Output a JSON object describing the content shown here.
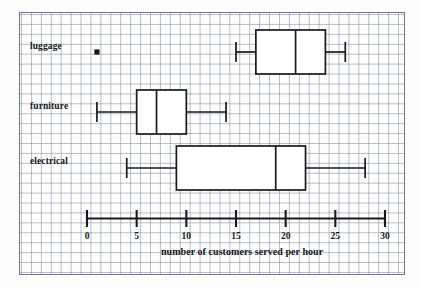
{
  "chart_data": {
    "type": "box",
    "title": "",
    "xlabel": "number of customers served per hour",
    "ylabel": "",
    "xlim": [
      0,
      30
    ],
    "xticks": [
      0,
      5,
      10,
      15,
      20,
      25,
      30
    ],
    "xtick_labels": [
      "0",
      "5",
      "10",
      "15",
      "20",
      "25",
      "30"
    ],
    "grid": true,
    "legend": "none",
    "orientation": "horizontal",
    "categories": [
      "luggage",
      "furniture",
      "electrical"
    ],
    "boxes": [
      {
        "category": "luggage",
        "whisker_low": 15,
        "q1": 17,
        "median": 21,
        "q3": 24,
        "whisker_high": 26,
        "outliers": [
          1
        ]
      },
      {
        "category": "furniture",
        "whisker_low": 1,
        "q1": 5,
        "median": 7,
        "q3": 10,
        "whisker_high": 14,
        "outliers": []
      },
      {
        "category": "electrical",
        "whisker_low": 4,
        "q1": 9,
        "median": 19,
        "q3": 22,
        "whisker_high": 28,
        "outliers": []
      }
    ]
  },
  "colors": {
    "line": "#1a1a1a",
    "box_fill": "#ffffff",
    "grid": "#788496",
    "paper_border": "#6e7a8c",
    "text": "#16181c"
  }
}
